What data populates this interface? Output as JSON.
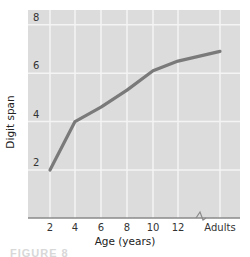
{
  "chart_data": {
    "type": "line",
    "title": "",
    "xlabel": "Age (years)",
    "ylabel": "Digit span",
    "categories": [
      "2",
      "4",
      "6",
      "8",
      "10",
      "12",
      "Adults"
    ],
    "series": [
      {
        "name": "Digit span",
        "x": [
          2,
          4,
          6,
          8,
          10,
          12,
          "Adults"
        ],
        "values": [
          2.0,
          4.0,
          4.6,
          5.3,
          6.1,
          6.5,
          6.9
        ]
      }
    ],
    "yticks": [
      "2",
      "4",
      "6",
      "8"
    ],
    "ylim": [
      1,
      8.4
    ],
    "grid": true,
    "axis_break": "between 12 and Adults",
    "colors": {
      "plot_bg": "#dcdcdc",
      "line": "#7a7a7a",
      "grid": "#f4f4f4"
    }
  },
  "caption_partial": "FIGURE 8"
}
